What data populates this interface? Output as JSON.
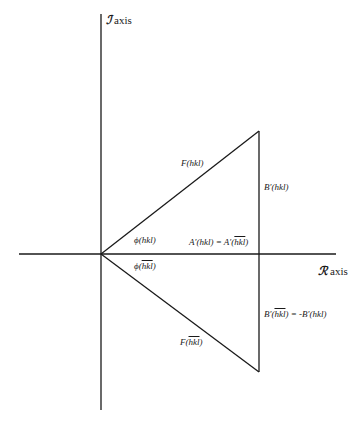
{
  "diagram": {
    "type": "argand-diagram",
    "axes": {
      "imaginary": {
        "symbol": "ℐ",
        "label": "axis"
      },
      "real": {
        "symbol": "ℛ",
        "label": "axis"
      }
    },
    "labels": {
      "F_hkl": "F(hkl)",
      "B_prime_hkl": "B′(hkl)",
      "phi_hkl": "ϕ(hkl)",
      "A_prime_eq": "A′(hkl) = A′(",
      "A_prime_eq_bar": "hkl",
      "A_prime_eq_end": ")",
      "phi_bar_prefix": "ϕ(",
      "phi_bar_hkl": "hkl",
      "phi_bar_suffix": ")",
      "B_prime_bar_prefix": "B′(",
      "B_prime_bar_hkl": "hkl",
      "B_prime_bar_suffix": ") = -B′(hkl)",
      "F_bar_prefix": "F(",
      "F_bar_hkl": "hkl",
      "F_bar_suffix": ")"
    },
    "geometry": {
      "origin": [
        101,
        254
      ],
      "upper_vertex": [
        259,
        131
      ],
      "lower_vertex": [
        259,
        372
      ],
      "vertical_axis": [
        14,
        410
      ],
      "horizontal_axis": [
        19,
        336
      ]
    },
    "colors": {
      "line": "#1a1a1a",
      "background": "#ffffff"
    }
  }
}
